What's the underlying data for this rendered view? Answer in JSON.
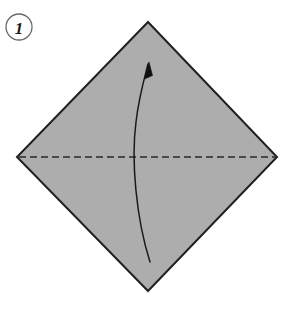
{
  "figure": {
    "kind": "origami-step-diagram",
    "width": 292,
    "height": 324,
    "background_color": "#ffffff"
  },
  "step_badge": {
    "label": "1",
    "shape": "circle",
    "center_x": 19,
    "center_y": 27,
    "radius": 13,
    "stroke_color": "#6a6a6a",
    "stroke_width": 1.3,
    "fill_color": "#ffffff",
    "text_color": "#1d1d1d"
  },
  "paper": {
    "name": "square-sheet-diamond-orientation",
    "fill_color": "#adadad",
    "stroke_color": "#202020",
    "stroke_width": 2,
    "vertices": [
      {
        "name": "top",
        "x": 148,
        "y": 22
      },
      {
        "name": "right",
        "x": 277,
        "y": 157
      },
      {
        "name": "bottom",
        "x": 148,
        "y": 291
      },
      {
        "name": "left",
        "x": 17,
        "y": 157
      }
    ]
  },
  "fold_line": {
    "name": "valley-fold-crease",
    "style": "dashed",
    "from_x": 19,
    "from_y": 157,
    "to_x": 275,
    "to_y": 157,
    "stroke_color": "#282828",
    "stroke_width": 1.6,
    "dash_length": 7,
    "gap_length": 4
  },
  "fold_arrow": {
    "name": "fold-direction-arrow",
    "direction": "upward",
    "stroke_color": "#1a1a1a",
    "stroke_width": 1.5,
    "path": "M 150 262 C 136 218 131 160 136 122 C 139 96 145 76 148 64",
    "tail_x": 150,
    "tail_y": 262,
    "tip_x": 149,
    "tip_y": 62,
    "arrowhead": {
      "fill_color": "#101010",
      "points": "149,62 144.5,79 152.5,75.5"
    }
  }
}
